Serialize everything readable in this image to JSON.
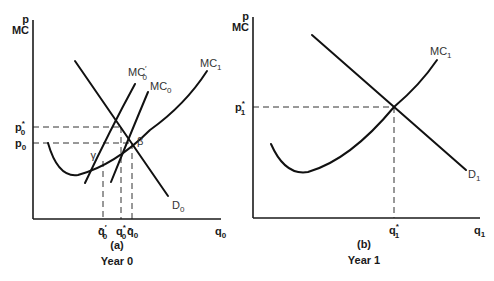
{
  "figure": {
    "panels": [
      {
        "id": "a",
        "caption_letter": "(a)",
        "caption_year": "Year 0",
        "y_axis_label_top": "p",
        "y_axis_label_bottom": "MC",
        "x_axis_label": "q",
        "x_axis_label_sub": "0",
        "axes": {
          "origin": [
            33,
            219
          ],
          "y_top": 20,
          "x_right": 221
        },
        "y_ticks": [
          {
            "label": "p",
            "sub": "0",
            "sup": "*",
            "y": 127
          },
          {
            "label": "p",
            "sub": "0",
            "sup": "",
            "y": 143
          }
        ],
        "x_ticks": [
          {
            "label": "q̄",
            "sub": "0",
            "sup": "′",
            "x": 103
          },
          {
            "label": "q",
            "sub": "0",
            "sup": "*",
            "x": 121
          },
          {
            "label": "q̄",
            "sub": "0",
            "sup": "",
            "x": 132
          }
        ],
        "points": [
          {
            "label": "γ",
            "x": 102,
            "y": 161
          },
          {
            "label": "β",
            "x": 132,
            "y": 143
          }
        ],
        "curves": [
          {
            "name": "D",
            "sub": "0",
            "sup": "",
            "type": "demand",
            "path": "M75,61 L168,196",
            "label_pos": [
              172,
              209
            ]
          },
          {
            "name": "MC",
            "sub": "0",
            "sup": "′",
            "type": "marginal-cost",
            "path": "M85,183 Q110,130 135,84",
            "label_pos": [
              128,
              76
            ]
          },
          {
            "name": "MC",
            "sub": "0",
            "sup": "",
            "type": "marginal-cost",
            "path": "M111,182 Q130,135 148,92",
            "label_pos": [
              150,
              90
            ]
          },
          {
            "name": "MC",
            "sub": "1",
            "sup": "",
            "type": "marginal-cost",
            "path": "M48,143 Q58,178 78,175 Q115,165 150,130 Q185,105 207,71",
            "label_pos": [
              200,
              67
            ]
          }
        ]
      },
      {
        "id": "b",
        "caption_letter": "(b)",
        "caption_year": "Year 1",
        "y_axis_label_top": "p",
        "y_axis_label_bottom": "MC",
        "x_axis_label": "q",
        "x_axis_label_sub": "1",
        "axes": {
          "origin": [
            253,
            218
          ],
          "y_top": 17,
          "x_right": 480
        },
        "y_ticks": [
          {
            "label": "p",
            "sub": "1",
            "sup": "*",
            "y": 107
          }
        ],
        "x_ticks": [
          {
            "label": "q",
            "sub": "1",
            "sup": "*",
            "x": 394
          }
        ],
        "points": [],
        "curves": [
          {
            "name": "D",
            "sub": "1",
            "sup": "",
            "type": "demand",
            "path": "M312,35 L466,170",
            "label_pos": [
              468,
              178
            ]
          },
          {
            "name": "MC",
            "sub": "1",
            "sup": "",
            "type": "marginal-cost",
            "path": "M271,144 Q285,176 308,172 Q350,160 394,107 Q420,85 437,60",
            "label_pos": [
              430,
              55
            ]
          }
        ]
      }
    ]
  }
}
